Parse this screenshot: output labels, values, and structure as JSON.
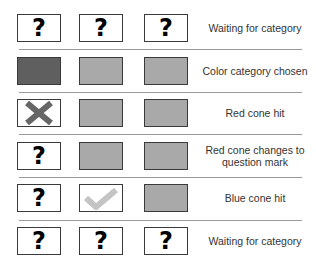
{
  "colors": {
    "dark_fill": "#5f5f5f",
    "gray_fill": "#a9a9a9",
    "x_mark": "#666666",
    "check_mark": "#c4c4c4",
    "border": "#3a3a3a",
    "separator": "#9a9a9a"
  },
  "rows": [
    {
      "cells": [
        "question",
        "question",
        "question"
      ],
      "label": "Waiting for category"
    },
    {
      "cells": [
        "dark",
        "gray",
        "gray"
      ],
      "label": "Color category chosen"
    },
    {
      "cells": [
        "x-mark",
        "gray",
        "gray"
      ],
      "label": "Red cone hit"
    },
    {
      "cells": [
        "question",
        "gray",
        "gray"
      ],
      "label": "Red cone changes to question mark"
    },
    {
      "cells": [
        "question",
        "check-mark",
        "gray"
      ],
      "label": "Blue cone hit"
    },
    {
      "cells": [
        "question",
        "question",
        "question"
      ],
      "label": "Waiting for category"
    }
  ],
  "glyphs": {
    "question": "?"
  }
}
